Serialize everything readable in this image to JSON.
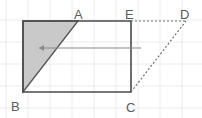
{
  "figure": {
    "canvas": {
      "width": 202,
      "height": 118,
      "background": "#ffffff"
    },
    "grid": {
      "visible": true,
      "color": "#e8ecef",
      "spacing": 22,
      "x_lines": [
        6,
        28,
        50,
        72,
        94,
        116,
        138,
        160,
        182
      ],
      "y_lines": [
        20,
        42,
        64,
        86,
        108
      ]
    },
    "points": {
      "A": {
        "x": 78,
        "y": 21,
        "label": "A",
        "label_x": 74,
        "label_y": 15
      },
      "B": {
        "x": 23,
        "y": 92,
        "label": "B",
        "label_x": 11,
        "label_y": 107
      },
      "C": {
        "x": 131,
        "y": 92,
        "label": "C",
        "label_x": 126,
        "label_y": 108
      },
      "D": {
        "x": 186,
        "y": 21,
        "label": "D",
        "label_x": 180,
        "label_y": 15
      },
      "E": {
        "x": 131,
        "y": 21,
        "label": "E",
        "label_x": 125,
        "label_y": 15
      },
      "TL": {
        "x": 23,
        "y": 21,
        "label": "",
        "label_x": 0,
        "label_y": 0
      }
    },
    "rectangle": {
      "name": "outer-rectangle",
      "stroke": "#4a4a4a",
      "stroke_width": 1.6,
      "fill": "none",
      "path": "M 23 21 L 131 21 L 131 92 L 23 92 Z"
    },
    "shaded_triangle": {
      "name": "shaded-triangle",
      "fill": "#c9c9c9",
      "stroke": "#555555",
      "stroke_width": 1.4,
      "path": "M 23 21 L 78 21 L 23 92 Z"
    },
    "dashed_lines": [
      {
        "name": "segment-E-D",
        "from": "E",
        "to": "D",
        "x1": 131,
        "y1": 21,
        "x2": 186,
        "y2": 21,
        "stroke": "#6f6f6f",
        "dash": "2,2"
      },
      {
        "name": "segment-C-D",
        "from": "C",
        "to": "D",
        "x1": 131,
        "y1": 92,
        "x2": 186,
        "y2": 21,
        "stroke": "#6f6f6f",
        "dash": "2,2"
      }
    ],
    "arrow": {
      "name": "translation-arrow",
      "direction": "left",
      "x_start": 141,
      "x_end": 39,
      "y": 48,
      "stroke": "#8a8a8a",
      "stroke_width": 1.1,
      "head_size": 5
    },
    "labels": [
      "A",
      "B",
      "C",
      "D",
      "E"
    ]
  }
}
